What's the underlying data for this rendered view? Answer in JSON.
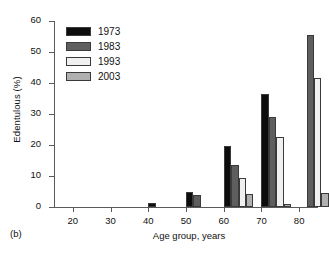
{
  "figure": {
    "panel_tag": "(b)",
    "xlabel": "Age group, years",
    "ylabel": "Edentulous (%)"
  },
  "legend": {
    "position": "top-left-inside",
    "entries": [
      {
        "label": "1973",
        "color": "#0d0d0d"
      },
      {
        "label": "1983",
        "color": "#5e5e5e"
      },
      {
        "label": "1993",
        "color": "#f0f0f0"
      },
      {
        "label": "2003",
        "color": "#b0b0b0"
      }
    ]
  },
  "axes": {
    "y_ticks": [
      "0",
      "10",
      "20",
      "30",
      "40",
      "50",
      "60"
    ],
    "x_ticks": [
      "20",
      "30",
      "40",
      "50",
      "60",
      "70",
      "80"
    ]
  },
  "chart_data": {
    "type": "bar",
    "title": "",
    "xlabel": "Age group, years",
    "ylabel": "Edentulous (%)",
    "categories": [
      "20",
      "30",
      "40",
      "50",
      "60",
      "70",
      "80"
    ],
    "ylim": [
      0,
      60
    ],
    "xlim": [
      15,
      85
    ],
    "yticks": [
      0,
      10,
      20,
      30,
      40,
      50,
      60
    ],
    "xticks": [
      20,
      30,
      40,
      50,
      60,
      70,
      80
    ],
    "grid": false,
    "legend_position": "upper left",
    "series": [
      {
        "name": "1973",
        "color": "#0d0d0d",
        "values": [
          0,
          0,
          1.2,
          5.0,
          19.8,
          36.5,
          null
        ]
      },
      {
        "name": "1983",
        "color": "#5e5e5e",
        "values": [
          0,
          0,
          0,
          4.0,
          13.7,
          29.0,
          55.5
        ]
      },
      {
        "name": "1993",
        "color": "#f0f0f0",
        "values": [
          0,
          0,
          0,
          0,
          9.2,
          22.5,
          41.5
        ]
      },
      {
        "name": "2003",
        "color": "#b0b0b0",
        "values": [
          0,
          0,
          0,
          0,
          4.3,
          1.0,
          4.5
        ]
      }
    ]
  }
}
